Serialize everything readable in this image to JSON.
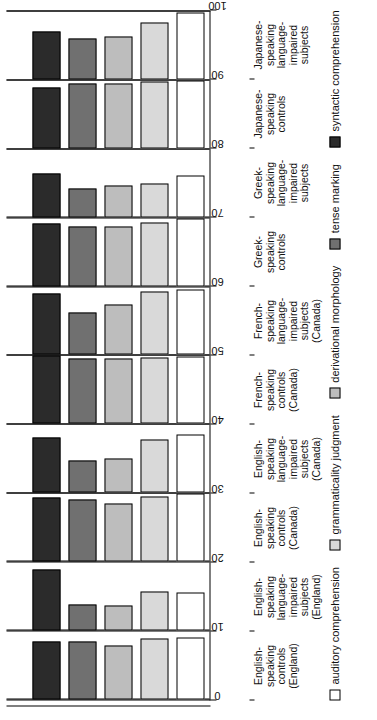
{
  "chart_data": {
    "type": "bar",
    "orientation": "horizontal",
    "title": "",
    "xlabel": "",
    "ylabel": "",
    "xlim": [
      0,
      100
    ],
    "ticks": [
      0,
      10,
      20,
      30,
      40,
      50,
      60,
      70,
      80,
      90,
      100
    ],
    "grid": true,
    "legend_position": "bottom",
    "categories": [
      "English-\nspeaking\ncontrols\n(England)",
      "English-\nspeaking\nlanguage-\nimpaired\nsubjects\n(England)",
      "English-\nspeaking\ncontrols\n(Canada)",
      "English-\nspeaking\nlanguage-\nimpaired\nsubjects\n(Canada)",
      "French-\nspeaking\ncontrols\n(Canada)",
      "French-\nspeaking\nlanguage-\nimpaired\nsubjects\n(Canada)",
      "Greek-\nspeaking\ncontrols",
      "Greek-\nspeaking\nlanguage-\nimpaired\nsubjects",
      "Japanese-\nspeaking\ncontrols",
      "Japanese-\nspeaking\nlanguage-\nimpaired\nsubjects"
    ],
    "series": [
      {
        "name": "auditory comprehension",
        "color": "#ffffff",
        "values": [
          92,
          56,
          100,
          86,
          99,
          97,
          99,
          62,
          100,
          98
        ]
      },
      {
        "name": "grammaticality judgment",
        "color": "#d9d9d9",
        "values": [
          90,
          57,
          96,
          78,
          98,
          93,
          94,
          50,
          98,
          83
        ]
      },
      {
        "name": "derivational morphology",
        "color": "#bdbdbd",
        "values": [
          80,
          37,
          86,
          51,
          97,
          75,
          87,
          46,
          96,
          63
        ]
      },
      {
        "name": "tense marking",
        "color": "#707070",
        "values": [
          85,
          39,
          91,
          47,
          96,
          62,
          88,
          42,
          95,
          60
        ]
      },
      {
        "name": "syntactic comprehension",
        "color": "#2b2b2b",
        "values": [
          86,
          90,
          95,
          81,
          100,
          90,
          92,
          65,
          90,
          71
        ]
      }
    ]
  },
  "legend": {
    "items": [
      {
        "label": "auditory comprehension",
        "color": "#ffffff"
      },
      {
        "label": "grammaticality judgment",
        "color": "#d9d9d9"
      },
      {
        "label": "derivational morphology",
        "color": "#bdbdbd"
      },
      {
        "label": "tense marking",
        "color": "#707070"
      },
      {
        "label": "syntactic comprehension",
        "color": "#2b2b2b"
      }
    ]
  }
}
